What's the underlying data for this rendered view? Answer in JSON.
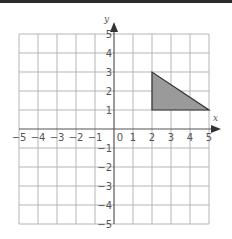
{
  "diagram": {
    "type": "coordinate-grid",
    "axes": {
      "x_label": "x",
      "y_label": "y",
      "x_range": [
        -5,
        5
      ],
      "y_range": [
        -5,
        5
      ],
      "x_ticks": [
        "-5",
        "-4",
        "-3",
        "-2",
        "-1",
        "0",
        "1",
        "2",
        "3",
        "4",
        "5"
      ],
      "y_ticks": [
        "5",
        "4",
        "3",
        "2",
        "1",
        "-1",
        "-2",
        "-3",
        "-4",
        "-5"
      ]
    },
    "shapes": [
      {
        "name": "triangle",
        "vertices": [
          [
            2,
            1
          ],
          [
            2,
            3
          ],
          [
            5,
            1
          ]
        ],
        "fill": "#9a9a9a",
        "stroke": "#333333"
      }
    ],
    "colors": {
      "grid": "#b5b5b5",
      "axis": "#555555",
      "top_bar": "#2b2b2b"
    }
  }
}
